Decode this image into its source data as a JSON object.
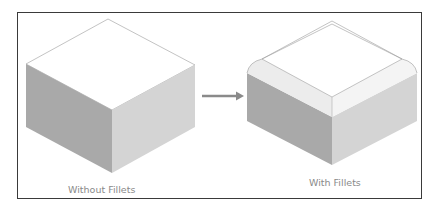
{
  "figure": {
    "left_caption": "Without Fillets",
    "right_caption": "With Fillets",
    "arrow": "right-arrow",
    "colors": {
      "frame": "#3a3a3a",
      "caption": "#8a8a8a",
      "top_face": "#ffffff",
      "left_face": "#a9a9a9",
      "right_face": "#d4d4d4",
      "edge": "#9a9a9a",
      "arrow": "#8a8a8a"
    }
  }
}
